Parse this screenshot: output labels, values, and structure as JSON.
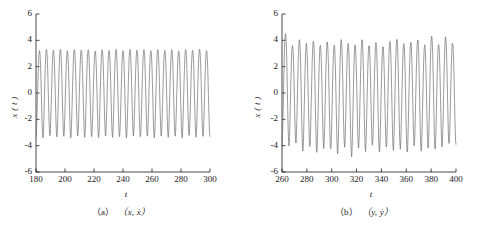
{
  "figure": {
    "background": "#ffffff",
    "line_color": "#6f6f6f",
    "axis_color": "#1a1a1a"
  },
  "chart_data": [
    {
      "type": "line",
      "panel": "a",
      "title": "",
      "caption": "（a）（x, ẋ）",
      "caption_label": "（a）",
      "caption_vars": "（x, ẋ）",
      "xlabel": "t",
      "ylabel": "x ( t )",
      "xlim": [
        180,
        300
      ],
      "ylim": [
        -6,
        6
      ],
      "grid": false,
      "legend": "none",
      "xticks": [
        180,
        200,
        220,
        240,
        260,
        280,
        300
      ],
      "xticklabels": [
        "180",
        "200",
        "220",
        "240",
        "260",
        "280",
        "300"
      ],
      "yticks": [
        6,
        4,
        2,
        0,
        -2,
        -4,
        -6
      ],
      "yticklabels": [
        "6",
        "4",
        "2",
        "0",
        "-2",
        "-4",
        "-6"
      ],
      "series": [
        {
          "name": "x(t)",
          "description": "periodic oscillation, amplitude about plus/minus 3.2, roughly 25 cycles over t = 180 to 300",
          "period": 4.8,
          "amplitude_positive": 3.25,
          "amplitude_negative": -3.3,
          "peaks": [
            3.2,
            3.3,
            3.25,
            3.3,
            3.2,
            3.3,
            3.25,
            3.3,
            3.2,
            3.3,
            3.25,
            3.3,
            3.2,
            3.3,
            3.25,
            3.3,
            3.2,
            3.3,
            3.25,
            3.3,
            3.2,
            3.3,
            3.25,
            3.3,
            3.2
          ],
          "troughs": [
            -3.3,
            -3.4,
            -3.25,
            -3.35,
            -3.3,
            -3.4,
            -3.25,
            -3.35,
            -3.3,
            -3.4,
            -3.25,
            -3.35,
            -3.3,
            -3.4,
            -3.25,
            -3.35,
            -3.3,
            -3.4,
            -3.25,
            -3.35,
            -3.3,
            -3.4,
            -3.25,
            -3.35,
            -3.3
          ]
        }
      ]
    },
    {
      "type": "line",
      "panel": "b",
      "title": "",
      "caption": "（b）（y, ẏ）",
      "caption_label": "（b）",
      "caption_vars": "（y, ẏ）",
      "xlabel": "t",
      "ylabel": "x ( t )",
      "xlim": [
        260,
        400
      ],
      "ylim": [
        -6,
        6
      ],
      "grid": false,
      "legend": "none",
      "xticks": [
        260,
        280,
        300,
        320,
        340,
        360,
        380,
        400
      ],
      "xticklabels": [
        "260",
        "280",
        "300",
        "320",
        "340",
        "360",
        "380",
        "400"
      ],
      "yticks": [
        6,
        4,
        2,
        0,
        -2,
        -4,
        -6
      ],
      "yticklabels": [
        "6",
        "4",
        "2",
        "0",
        "-2",
        "-4",
        "-6"
      ],
      "series": [
        {
          "name": "x(t)",
          "description": "irregular quasi-periodic oscillation, amplitude varying about plus/minus 3.5 to 4.6, roughly 25 cycles over t = 260 to 400",
          "period": 5.6,
          "amplitude_positive": 4.2,
          "amplitude_negative": -4.3,
          "peaks": [
            4.5,
            3.6,
            4.0,
            3.7,
            3.9,
            3.6,
            3.8,
            3.6,
            4.0,
            3.7,
            3.6,
            4.0,
            3.6,
            3.8,
            3.5,
            3.9,
            4.1,
            3.7,
            3.8,
            4.0,
            3.6,
            4.3,
            3.7,
            4.2,
            3.8
          ],
          "troughs": [
            -3.9,
            -4.0,
            -3.8,
            -4.4,
            -4.1,
            -4.5,
            -4.2,
            -4.3,
            -4.6,
            -4.1,
            -4.8,
            -4.2,
            -4.4,
            -4.0,
            -4.5,
            -4.1,
            -4.3,
            -4.2,
            -4.5,
            -4.0,
            -4.4,
            -4.2,
            -4.3,
            -4.1,
            -3.9
          ]
        }
      ]
    }
  ]
}
